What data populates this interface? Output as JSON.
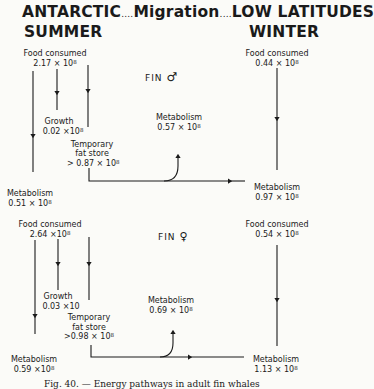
{
  "header": {
    "left_top": "ANTARCTIC",
    "dots1": "....",
    "middle": "Migration",
    "dots2": "....",
    "right_top": "LOW LATITUDES",
    "left_bottom": "SUMMER",
    "right_bottom": "WINTER"
  },
  "male": {
    "label": "FIN",
    "symbol": "♂",
    "summer_food_label": "Food consumed",
    "summer_food_value": "2.17 × 10",
    "growth_label": "Growth",
    "growth_value": "0.02 ×10",
    "fat_label_1": "Temporary",
    "fat_label_2": "fat store",
    "fat_value": "> 0.87 × 10",
    "summer_metab_label": "Metabolism",
    "summer_metab_value": "0.51 × 10",
    "migration_metab_label": "Metabolism",
    "migration_metab_value": "0.57 × 10",
    "winter_food_label": "Food consumed",
    "winter_food_value": "0.44 × 10",
    "winter_metab_label": "Metabolism",
    "winter_metab_value": "0.97 × 10",
    "exp": "8"
  },
  "female": {
    "label": "FIN",
    "symbol": "♀",
    "summer_food_label": "Food consumed",
    "summer_food_value": "2.64 ×10",
    "growth_label": "Growth",
    "growth_value": "0.03 ×10",
    "fat_label_1": "Temporary",
    "fat_label_2": "fat store",
    "fat_value": ">0.98 × 10",
    "summer_metab_label": "Metabolism",
    "summer_metab_value": "0.59 ×10",
    "migration_metab_label": "Metabolism",
    "migration_metab_value": "0.69 × 10",
    "winter_food_label": "Food consumed",
    "winter_food_value": "0.54 × 10",
    "winter_metab_label": "Metabolism",
    "winter_metab_value": "1.13 × 10",
    "exp": "8"
  },
  "caption": "Fig. 40. — Energy pathways in adult fin whales"
}
